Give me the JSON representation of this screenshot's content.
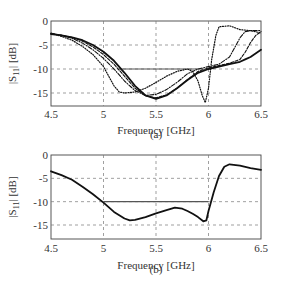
{
  "chart_data": [
    {
      "type": "line",
      "panel": "(a)",
      "caption": "(a)",
      "xlabel": "Frequency [GHz]",
      "ylabel": "|S11| [dB]",
      "xlim": [
        4.5,
        6.5
      ],
      "ylim": [
        -18,
        0
      ],
      "xticks": [
        "4.5",
        "5",
        "5.5",
        "6",
        "6.5"
      ],
      "yticks": [
        "0",
        "-5",
        "-10",
        "-15"
      ],
      "grid": true,
      "reference_line": {
        "y": -10,
        "x_start": 5.15,
        "x_end": 5.95
      },
      "series": [
        {
          "name": "curve-1",
          "style": "dotted",
          "x": [
            4.5,
            4.6,
            4.7,
            4.8,
            4.9,
            5.0,
            5.05,
            5.1,
            5.15,
            5.2,
            5.3,
            5.4,
            5.5,
            5.6,
            5.7,
            5.8,
            5.85,
            5.9,
            5.94,
            5.97,
            6.0,
            6.03,
            6.07,
            6.1,
            6.2,
            6.3,
            6.4,
            6.5
          ],
          "values": [
            -2.5,
            -3.2,
            -4.0,
            -5.3,
            -7.0,
            -9.5,
            -11.5,
            -13.5,
            -14.8,
            -15.0,
            -14.8,
            -14.0,
            -12.8,
            -11.5,
            -10.5,
            -10.0,
            -10.5,
            -12.5,
            -15.5,
            -17.0,
            -14.0,
            -8.0,
            -3.0,
            -1.2,
            -1.0,
            -1.8,
            -2.0,
            -2.5
          ]
        },
        {
          "name": "curve-2",
          "style": "dash-dot",
          "x": [
            4.5,
            4.6,
            4.7,
            4.8,
            4.9,
            5.0,
            5.1,
            5.2,
            5.3,
            5.4,
            5.5,
            5.6,
            5.7,
            5.8,
            5.9,
            6.0,
            6.1,
            6.2,
            6.25,
            6.3,
            6.35,
            6.4,
            6.5
          ],
          "values": [
            -2.6,
            -3.0,
            -3.6,
            -4.6,
            -6.0,
            -7.8,
            -10.0,
            -12.5,
            -14.5,
            -15.5,
            -15.3,
            -14.3,
            -12.8,
            -11.0,
            -10.0,
            -9.5,
            -9.0,
            -7.5,
            -5.5,
            -3.5,
            -2.2,
            -2.0,
            -2.0
          ]
        },
        {
          "name": "curve-3",
          "style": "dashed",
          "x": [
            4.5,
            4.6,
            4.7,
            4.8,
            4.9,
            5.0,
            5.1,
            5.2,
            5.3,
            5.4,
            5.5,
            5.6,
            5.7,
            5.8,
            5.9,
            6.0,
            6.1,
            6.2,
            6.3,
            6.35,
            6.4,
            6.45,
            6.5
          ],
          "values": [
            -2.6,
            -3.0,
            -3.4,
            -4.2,
            -5.4,
            -7.0,
            -9.0,
            -11.5,
            -14.0,
            -15.6,
            -16.0,
            -15.4,
            -14.0,
            -12.2,
            -10.5,
            -9.8,
            -9.3,
            -8.8,
            -8.0,
            -6.5,
            -4.5,
            -3.0,
            -2.2
          ]
        },
        {
          "name": "curve-4",
          "style": "solid-thick",
          "x": [
            4.5,
            4.6,
            4.7,
            4.8,
            4.9,
            5.0,
            5.1,
            5.2,
            5.3,
            5.4,
            5.5,
            5.6,
            5.7,
            5.8,
            5.9,
            6.0,
            6.1,
            6.2,
            6.3,
            6.35,
            6.4,
            6.5
          ],
          "values": [
            -2.7,
            -3.0,
            -3.4,
            -4.0,
            -5.0,
            -6.4,
            -8.3,
            -10.8,
            -13.5,
            -15.5,
            -16.2,
            -15.5,
            -14.0,
            -12.3,
            -10.8,
            -10.0,
            -9.5,
            -9.0,
            -8.5,
            -8.0,
            -7.5,
            -6.0
          ]
        }
      ]
    },
    {
      "type": "line",
      "panel": "(b)",
      "caption": "(b)",
      "xlabel": "Frequency [GHz]",
      "ylabel": "|S11| [dB]",
      "xlim": [
        4.5,
        6.5
      ],
      "ylim": [
        -18,
        0
      ],
      "xticks": [
        "4.5",
        "5",
        "5.5",
        "6",
        "6.5"
      ],
      "yticks": [
        "0",
        "-5",
        "-10",
        "-15"
      ],
      "grid": true,
      "reference_line": {
        "y": -10,
        "x_start": 5.0,
        "x_end": 6.0
      },
      "series": [
        {
          "name": "measured",
          "style": "solid-thick",
          "x": [
            4.5,
            4.6,
            4.7,
            4.8,
            4.9,
            5.0,
            5.1,
            5.2,
            5.25,
            5.3,
            5.4,
            5.5,
            5.6,
            5.68,
            5.75,
            5.8,
            5.85,
            5.9,
            5.95,
            5.98,
            6.0,
            6.05,
            6.1,
            6.15,
            6.2,
            6.3,
            6.4,
            6.5
          ],
          "values": [
            -3.5,
            -4.3,
            -5.3,
            -6.8,
            -8.4,
            -10.2,
            -12.2,
            -13.6,
            -14.0,
            -13.9,
            -13.3,
            -12.5,
            -11.8,
            -11.3,
            -11.5,
            -12.0,
            -12.6,
            -13.3,
            -14.2,
            -14.0,
            -12.0,
            -8.0,
            -4.5,
            -2.5,
            -2.0,
            -2.3,
            -2.8,
            -3.2
          ]
        }
      ]
    }
  ]
}
